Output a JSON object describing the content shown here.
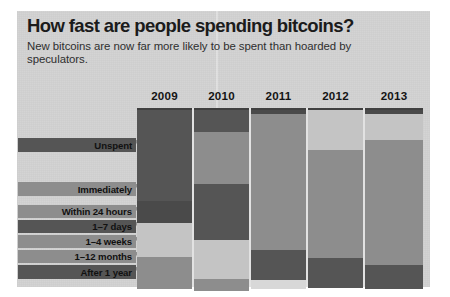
{
  "header": {
    "title": "How fast are people spending bitcoins?",
    "subtitle": "New bitcoins are now far more likely to be spent than hoarded by speculators."
  },
  "colors": {
    "paper": "#d2d2d2",
    "dark": "#555555",
    "darker": "#4a4a4a",
    "medium": "#8d8d8d",
    "light": "#c4c4c4",
    "lighter": "#d8d8d8",
    "text": "#141414"
  },
  "chart_data": {
    "type": "bar",
    "subtype": "stacked-column-100pct",
    "title": "How fast are people spending bitcoins?",
    "subtitle": "New bitcoins are now far more likely to be spent than hoarded by speculators.",
    "xlabel": "",
    "ylabel": "",
    "grid": false,
    "legend_position": "left-labels",
    "categories": [
      "2009",
      "2010",
      "2011",
      "2012",
      "2013"
    ],
    "series": [
      {
        "name": "Unspent",
        "values": [
          58,
          12,
          2,
          0,
          2
        ]
      },
      {
        "name": "Immediately",
        "values": [
          0,
          29,
          0,
          22,
          14
        ]
      },
      {
        "name": "Within 24 hours",
        "values": [
          12,
          0,
          0,
          0,
          0
        ]
      },
      {
        "name": "1–7 days",
        "values": [
          0,
          31,
          77,
          60,
          71
        ]
      },
      {
        "name": "1–4 weeks",
        "values": [
          19,
          0,
          0,
          0,
          0
        ]
      },
      {
        "name": "1–12 months",
        "values": [
          0,
          22,
          17,
          18,
          13
        ]
      },
      {
        "name": "After 1 year",
        "values": [
          11,
          6,
          4,
          0,
          0
        ]
      }
    ],
    "row_labels": [
      "Unspent",
      "Immediately",
      "Within 24 hours",
      "1–7 days",
      "1–4 weeks",
      "1–12 months",
      "After 1 year"
    ]
  },
  "labels": [
    {
      "text": "Unspent",
      "left": 1,
      "top": 30,
      "width": 118,
      "height": 14,
      "tone": "dark"
    },
    {
      "text": "Immediately",
      "left": 1,
      "top": 74,
      "width": 118,
      "height": 14,
      "tone": "medium"
    },
    {
      "text": "Within 24 hours",
      "left": 1,
      "top": 97,
      "width": 118,
      "height": 13,
      "tone": "medium"
    },
    {
      "text": "1–7 days",
      "left": 1,
      "top": 112,
      "width": 118,
      "height": 13,
      "tone": "dark"
    },
    {
      "text": "1–4 weeks",
      "left": 1,
      "top": 127,
      "width": 118,
      "height": 13,
      "tone": "medium"
    },
    {
      "text": "1–12 months",
      "left": 1,
      "top": 142,
      "width": 118,
      "height": 13,
      "tone": "medium"
    },
    {
      "text": "After 1 year",
      "left": 1,
      "top": 157,
      "width": 118,
      "height": 14,
      "tone": "dark"
    }
  ],
  "columns": [
    {
      "year": "2009",
      "left": 120,
      "width": 55,
      "segments": [
        {
          "name": "Unspent",
          "top": 2,
          "height": 91,
          "tone": "dark"
        },
        {
          "name": "Within 24 hours",
          "top": 93,
          "height": 22,
          "tone": "darker"
        },
        {
          "name": "1–4 weeks",
          "top": 115,
          "height": 34,
          "tone": "light"
        },
        {
          "name": "After 1 year",
          "top": 149,
          "height": 32,
          "tone": "medium"
        }
      ]
    },
    {
      "year": "2010",
      "left": 177,
      "width": 55,
      "segments": [
        {
          "name": "Unspent",
          "top": 2,
          "height": 22,
          "tone": "dark"
        },
        {
          "name": "Immediately",
          "top": 24,
          "height": 52,
          "tone": "medium"
        },
        {
          "name": "1–7 days",
          "top": 76,
          "height": 56,
          "tone": "dark"
        },
        {
          "name": "1–12 months",
          "top": 132,
          "height": 39,
          "tone": "light"
        },
        {
          "name": "After 1 year",
          "top": 171,
          "height": 12,
          "tone": "medium"
        }
      ]
    },
    {
      "year": "2011",
      "left": 234,
      "width": 55,
      "segments": [
        {
          "name": "Unspent",
          "top": 2,
          "height": 4,
          "tone": "darker"
        },
        {
          "name": "1–7 days",
          "top": 6,
          "height": 136,
          "tone": "medium"
        },
        {
          "name": "1–12 months",
          "top": 142,
          "height": 30,
          "tone": "dark"
        },
        {
          "name": "After 1 year",
          "top": 172,
          "height": 9,
          "tone": "lighter"
        }
      ]
    },
    {
      "year": "2012",
      "left": 291,
      "width": 55,
      "segments": [
        {
          "name": "Immediately",
          "top": 2,
          "height": 40,
          "tone": "light"
        },
        {
          "name": "1–7 days",
          "top": 42,
          "height": 108,
          "tone": "medium"
        },
        {
          "name": "1–12 months",
          "top": 150,
          "height": 30,
          "tone": "dark"
        }
      ]
    },
    {
      "year": "2013",
      "left": 348,
      "width": 58,
      "segments": [
        {
          "name": "Unspent",
          "top": 2,
          "height": 4,
          "tone": "darker"
        },
        {
          "name": "Immediately",
          "top": 6,
          "height": 26,
          "tone": "light"
        },
        {
          "name": "1–7 days",
          "top": 32,
          "height": 125,
          "tone": "medium"
        },
        {
          "name": "1–12 months",
          "top": 157,
          "height": 24,
          "tone": "dark"
        }
      ]
    }
  ]
}
